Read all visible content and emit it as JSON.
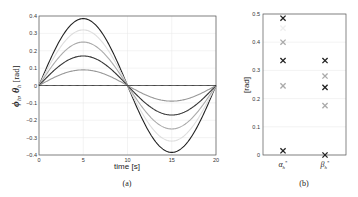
{
  "chart_data": [
    {
      "type": "line",
      "panel_label": "(a)",
      "title": "",
      "xlabel": "time [s]",
      "ylabel": "φ_h, θ_h [rad]",
      "xlim": [
        0,
        20
      ],
      "ylim": [
        -0.4,
        0.4
      ],
      "xticks": [
        "0",
        "5",
        "10",
        "15",
        "20"
      ],
      "yticks": [
        "-0.4",
        "-0.3",
        "-0.2",
        "-0.1",
        "0",
        "0.1",
        "0.2",
        "0.3",
        "0.4"
      ],
      "grid": true,
      "legend": null,
      "series": [
        {
          "name": "dark amplitude 0.385",
          "function": "0.385*sin(2*pi*t/20)",
          "amplitude": 0.385,
          "color": "#222222"
        },
        {
          "name": "faint amplitude 0.32",
          "function": "0.32*sin(2*pi*t/20)",
          "amplitude": 0.32,
          "color": "#dddddd"
        },
        {
          "name": "light amplitude 0.25",
          "function": "0.25*sin(2*pi*t/20)",
          "amplitude": 0.25,
          "color": "#aaaaaa"
        },
        {
          "name": "dark amplitude 0.17",
          "function": "0.17*sin(2*pi*t/20)",
          "amplitude": 0.17,
          "color": "#333333"
        },
        {
          "name": "light amplitude 0.09",
          "function": "0.09*sin(2*pi*t/20)",
          "amplitude": 0.09,
          "color": "#999999"
        },
        {
          "name": "zero",
          "function": "0",
          "amplitude": 0.0,
          "color": "#222222"
        }
      ]
    },
    {
      "type": "scatter",
      "panel_label": "(b)",
      "title": "",
      "xlabel": "",
      "ylabel": "[rad]",
      "ylim": [
        0,
        0.5
      ],
      "yticks": [
        "0",
        "0.1",
        "0.2",
        "0.3",
        "0.4",
        "0.5"
      ],
      "categories": [
        "α*_h",
        "β*_h"
      ],
      "grid": true,
      "marker": "x",
      "series": [
        {
          "category": "α*_h",
          "values": [
            0.485,
            0.45,
            0.4,
            0.335,
            0.245,
            0.015
          ],
          "colors": [
            "#222222",
            "#eeeeee",
            "#aaaaaa",
            "#222222",
            "#aaaaaa",
            "#222222"
          ]
        },
        {
          "category": "β*_h",
          "values": [
            0.335,
            0.28,
            0.24,
            0.175,
            0.0
          ],
          "colors": [
            "#222222",
            "#aaaaaa",
            "#222222",
            "#aaaaaa",
            "#222222"
          ]
        }
      ]
    }
  ],
  "labels": {
    "a": "(a)",
    "b": "(b)",
    "xlabel_a": "time [s]",
    "ylabel_b": "[rad]",
    "cat_alpha": "α",
    "cat_beta": "β"
  }
}
